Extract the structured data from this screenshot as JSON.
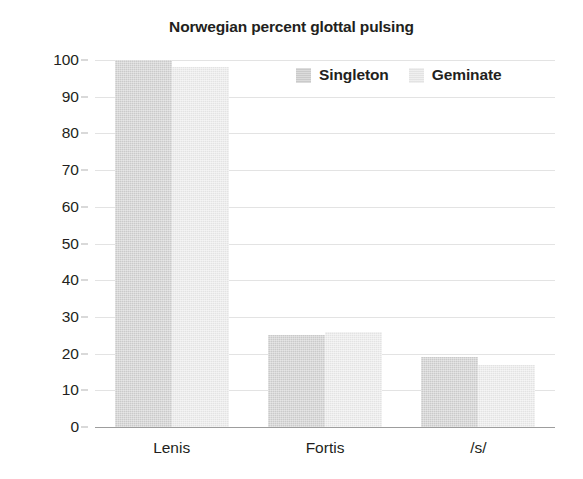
{
  "chart_data": {
    "type": "bar",
    "title": "Norwegian percent glottal pulsing",
    "xlabel": "",
    "ylabel": "",
    "categories": [
      "Lenis",
      "Fortis",
      "/s/"
    ],
    "series": [
      {
        "name": "Singleton",
        "values": [
          100,
          25,
          19
        ],
        "color": "#cacaca"
      },
      {
        "name": "Geminate",
        "values": [
          98,
          26,
          17
        ],
        "color": "#e3e3e3"
      }
    ],
    "ylim": [
      0,
      100
    ],
    "ytick_step": 10,
    "yticks": [
      100,
      90,
      80,
      70,
      60,
      50,
      40,
      30,
      20,
      10,
      0
    ],
    "ytick_labels": [
      "100",
      "90",
      "80",
      "70",
      "60",
      "50",
      "40",
      "30",
      "20",
      "10",
      "0"
    ],
    "grid": true,
    "grid_axis": "y",
    "legend_position": "top-right",
    "legend": [
      "Singleton",
      "Geminate"
    ],
    "background_color": "#ffffff",
    "text_color": "#231f20",
    "gridline_color": "#e3e3e3",
    "axis_color": "#9d9d9d"
  }
}
